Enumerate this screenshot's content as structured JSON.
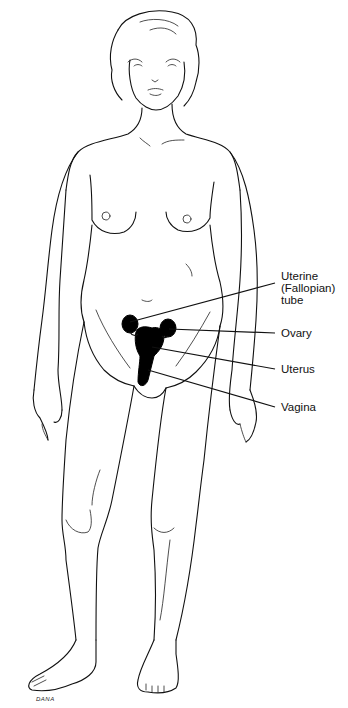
{
  "diagram": {
    "labels": [
      {
        "id": "fallopian-tube",
        "text": "Uterine\n(Fallopian)\ntube",
        "x": 281,
        "y": 270
      },
      {
        "id": "ovary",
        "text": "Ovary",
        "x": 281,
        "y": 328
      },
      {
        "id": "uterus",
        "text": "Uterus",
        "x": 281,
        "y": 364
      },
      {
        "id": "vagina",
        "text": "Vagina",
        "x": 281,
        "y": 402
      }
    ],
    "signature": "DANA"
  },
  "colors": {
    "background": "#ffffff",
    "ink": "#111111"
  }
}
